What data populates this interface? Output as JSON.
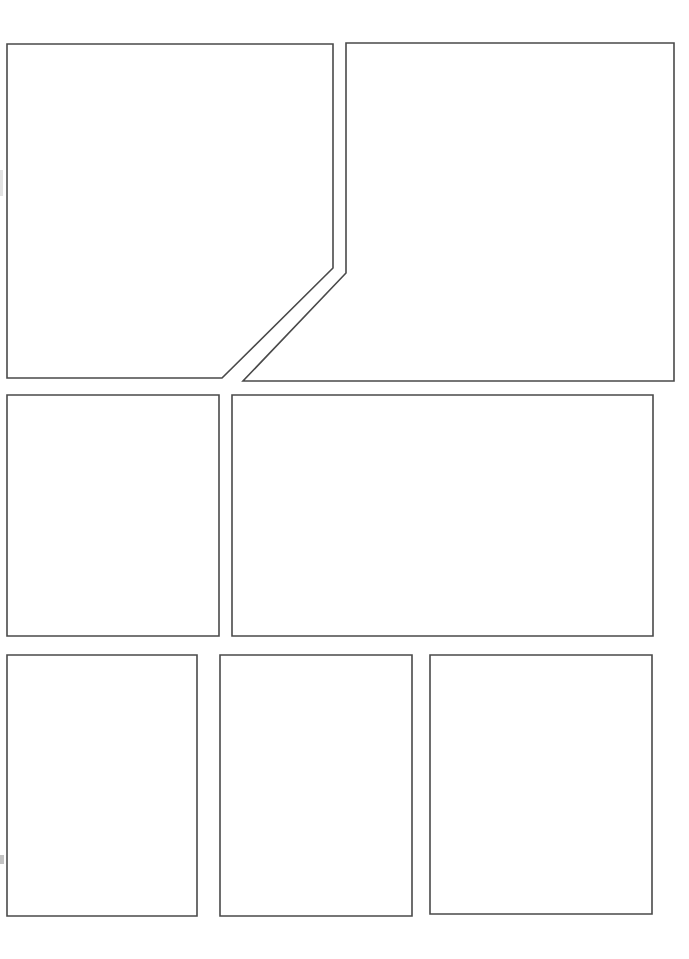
{
  "document": {
    "kind": "comic-page-template",
    "title": "Blank Comic Page Layout",
    "page_width": 689,
    "page_height": 959,
    "background_color": "#ffffff",
    "panel_border_color": "#4a4a4a",
    "panel_fill_color": "#ffffff",
    "panel_border_width": 1.6,
    "panel_count": 7,
    "row_count": 3
  },
  "rows": [
    {
      "name": "row-top",
      "label": "Row 1",
      "panel_count": 2,
      "top": 44,
      "bottom": 381
    },
    {
      "name": "row-middle",
      "label": "Row 2",
      "panel_count": 2,
      "top": 395,
      "bottom": 636
    },
    {
      "name": "row-bottom",
      "label": "Row 3",
      "panel_count": 3,
      "top": 655,
      "bottom": 916
    }
  ],
  "panels": [
    {
      "id": "panel-1",
      "label": "Panel 1",
      "row": "row-top",
      "shape": "angled-pentagon",
      "content": "",
      "points": "7,44 333,44 333,268 222,378 7,378"
    },
    {
      "id": "panel-2",
      "label": "Panel 2",
      "row": "row-top",
      "shape": "angled-pentagon",
      "content": "",
      "points": "346,43 674,43 674,381 243,381 346,273"
    },
    {
      "id": "panel-3",
      "label": "Panel 3",
      "row": "row-middle",
      "shape": "rectangle",
      "content": "",
      "points": "7,395 219,395 219,636 7,636"
    },
    {
      "id": "panel-4",
      "label": "Panel 4",
      "row": "row-middle",
      "shape": "rectangle",
      "content": "",
      "points": "232,395 653,395 653,636 232,636"
    },
    {
      "id": "panel-5",
      "label": "Panel 5",
      "row": "row-bottom",
      "shape": "rectangle",
      "content": "",
      "points": "7,655 197,655 197,916 7,916"
    },
    {
      "id": "panel-6",
      "label": "Panel 6",
      "row": "row-bottom",
      "shape": "rectangle",
      "content": "",
      "points": "220,655 412,655 412,916 220,916"
    },
    {
      "id": "panel-7",
      "label": "Panel 7",
      "row": "row-bottom",
      "shape": "rectangle",
      "content": "",
      "points": "430,655 652,655 652,914 430,914"
    }
  ]
}
